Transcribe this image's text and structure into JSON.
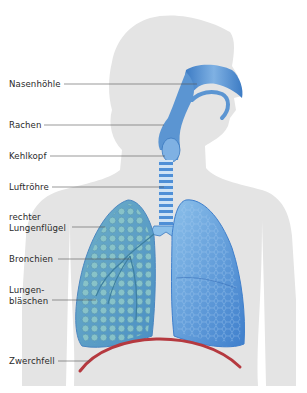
{
  "diagram": {
    "colors": {
      "background": "#ffffff",
      "silhouette": "#e4e4e4",
      "airway": "#5b95d2",
      "airway_dark": "#3a78bf",
      "lung_right_fill": "#6aa7cf",
      "lung_left_fill": "#4f8fd6",
      "alveoli": "#7fb8c9",
      "diaphragm": "#b5393f",
      "leader_line": "#555555",
      "label_text": "#2a2a2a"
    },
    "labels": [
      {
        "id": "nasenhoehle",
        "text": "Nasenhöhle",
        "x": 9,
        "y": 79
      },
      {
        "id": "rachen",
        "text": "Rachen",
        "x": 9,
        "y": 120
      },
      {
        "id": "kehlkopf",
        "text": "Kehlkopf",
        "x": 9,
        "y": 151
      },
      {
        "id": "luftroehre",
        "text": "Luftröhre",
        "x": 9,
        "y": 182
      },
      {
        "id": "rechter-lungenfluegel",
        "text": "rechter\nLungenflügel",
        "x": 9,
        "y": 213
      },
      {
        "id": "bronchien",
        "text": "Bronchien",
        "x": 9,
        "y": 254
      },
      {
        "id": "lungenblaeschen",
        "text": "Lungen-\nbläschen",
        "x": 9,
        "y": 286
      },
      {
        "id": "zwerchfell",
        "text": "Zwerchfell",
        "x": 9,
        "y": 355
      }
    ]
  }
}
